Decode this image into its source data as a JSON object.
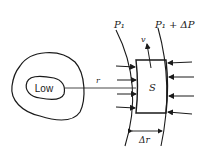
{
  "diagram": {
    "low_label": "Low",
    "radius_label": "r",
    "parcel_label": "S",
    "velocity_label": "v",
    "pressure_inner_label": "P₁",
    "pressure_outer_label": "P₁ + ΔP",
    "width_label": "Δr",
    "colors": {
      "stroke": "#1a1a1a",
      "background": "#ffffff"
    }
  }
}
